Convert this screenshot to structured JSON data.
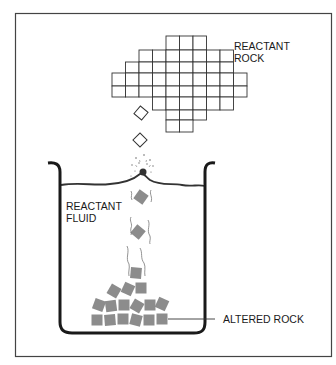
{
  "diagram": {
    "labels": {
      "reactant_rock": [
        "REACTANT",
        "ROCK"
      ],
      "reactant_fluid": [
        "REACTANT",
        "FLUID"
      ],
      "altered_rock": "ALTERED ROCK"
    },
    "colors": {
      "line": "#2a2a2a",
      "frame": "#333333",
      "grid_line": "#333333",
      "altered_fill": "#8c8c8c",
      "background": "#ffffff"
    },
    "reactant_rock_grid": {
      "cell_size": 13.5,
      "origin_x": 112,
      "origin_y": 36,
      "rows": [
        {
          "start": 4,
          "end": 6
        },
        {
          "start": 2,
          "end": 8
        },
        {
          "start": 1,
          "end": 8
        },
        {
          "start": 0,
          "end": 9
        },
        {
          "start": 0,
          "end": 9
        },
        {
          "start": 3,
          "end": 8
        },
        {
          "start": 4,
          "end": 6
        },
        {
          "start": 4,
          "end": 5
        }
      ]
    },
    "falling_fragments": [
      {
        "x": 141,
        "y": 113,
        "rotation": 40,
        "state": "unaltered"
      },
      {
        "x": 140,
        "y": 140,
        "rotation": 45,
        "state": "unaltered"
      },
      {
        "x": 141,
        "y": 197,
        "rotation": 35,
        "state": "altered"
      },
      {
        "x": 138,
        "y": 232,
        "rotation": 40,
        "state": "altered"
      },
      {
        "x": 136,
        "y": 273,
        "rotation": 5,
        "state": "altered"
      }
    ],
    "altered_pile": [
      {
        "x": 114,
        "y": 291,
        "r": 30
      },
      {
        "x": 128,
        "y": 289,
        "r": 25
      },
      {
        "x": 141,
        "y": 288,
        "r": 0
      },
      {
        "x": 99,
        "y": 305,
        "r": 20
      },
      {
        "x": 111,
        "y": 306,
        "r": -8
      },
      {
        "x": 124,
        "y": 305,
        "r": 0
      },
      {
        "x": 137,
        "y": 306,
        "r": 30
      },
      {
        "x": 150,
        "y": 305,
        "r": 0
      },
      {
        "x": 162,
        "y": 304,
        "r": 25
      },
      {
        "x": 97,
        "y": 320,
        "r": 0
      },
      {
        "x": 110,
        "y": 320,
        "r": -5
      },
      {
        "x": 123,
        "y": 319,
        "r": 0
      },
      {
        "x": 136,
        "y": 320,
        "r": 15
      },
      {
        "x": 149,
        "y": 320,
        "r": 0
      },
      {
        "x": 162,
        "y": 319,
        "r": 0
      }
    ]
  }
}
